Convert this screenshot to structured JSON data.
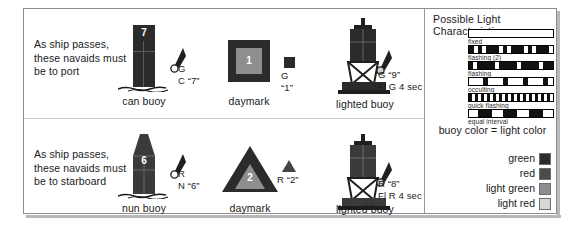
{
  "rows": [
    {
      "id": "port",
      "instruction": "As ship passes,\nthese navaids must\nbe to port",
      "buoy": {
        "caption": "can buoy",
        "number": "7",
        "color": "#2b2b2b"
      },
      "buoy_light_label": "G\nC “7”",
      "daymark": {
        "caption": "daymark",
        "number": "1"
      },
      "daymark_label": "G\n“1”",
      "lighted": {
        "caption": "lighted buoy",
        "number": "9"
      },
      "lighted_label": "G “9”\nFl G 4 sec"
    },
    {
      "id": "starboard",
      "instruction": "As ship passes,\nthese navaids must\nbe to starboard",
      "buoy": {
        "caption": "nun buoy",
        "number": "6",
        "color": "#3a3a3a"
      },
      "buoy_light_label": "R\nN “6”",
      "daymark": {
        "caption": "daymark",
        "number": "2"
      },
      "daymark_label": "R “2”",
      "lighted": {
        "caption": "lighted buoy",
        "number": "8"
      },
      "lighted_label": "R “8”\nFl R 4 sec"
    }
  ],
  "light_characteristics": {
    "title": "Possible Light Characteristics",
    "note": "buoy color  =  light color",
    "bars": [
      {
        "caption": "fixed",
        "style": "normal",
        "segments": []
      },
      {
        "caption": "flashing (2)",
        "style": "inverted",
        "segments": [
          {
            "x": 5,
            "w": 4
          },
          {
            "x": 13,
            "w": 4
          },
          {
            "x": 30,
            "w": 4
          },
          {
            "x": 38,
            "w": 4
          },
          {
            "x": 55,
            "w": 4
          },
          {
            "x": 63,
            "w": 4
          },
          {
            "x": 80,
            "w": 4
          }
        ]
      },
      {
        "caption": "flashing",
        "style": "inverted",
        "segments": [
          {
            "x": 4,
            "w": 4
          },
          {
            "x": 26,
            "w": 4
          },
          {
            "x": 48,
            "w": 4
          },
          {
            "x": 70,
            "w": 4
          }
        ]
      },
      {
        "caption": "occulting",
        "style": "normal",
        "segments": [
          {
            "x": 14,
            "w": 5
          },
          {
            "x": 34,
            "w": 5
          },
          {
            "x": 54,
            "w": 5
          },
          {
            "x": 74,
            "w": 5
          }
        ]
      },
      {
        "caption": "quick flashing",
        "style": "inverted",
        "segments": [
          {
            "x": 3,
            "w": 3
          },
          {
            "x": 9,
            "w": 3
          },
          {
            "x": 15,
            "w": 3
          },
          {
            "x": 21,
            "w": 3
          },
          {
            "x": 27,
            "w": 3
          },
          {
            "x": 33,
            "w": 3
          },
          {
            "x": 39,
            "w": 3
          },
          {
            "x": 45,
            "w": 3
          },
          {
            "x": 51,
            "w": 3
          },
          {
            "x": 57,
            "w": 3
          },
          {
            "x": 63,
            "w": 3
          },
          {
            "x": 69,
            "w": 3
          },
          {
            "x": 75,
            "w": 3
          },
          {
            "x": 81,
            "w": 3
          }
        ]
      },
      {
        "caption": "equal interval",
        "style": "normal",
        "segments": [
          {
            "x": 9,
            "w": 14
          },
          {
            "x": 34,
            "w": 14
          },
          {
            "x": 60,
            "w": 14
          }
        ]
      }
    ]
  },
  "color_legend": [
    {
      "label": "green",
      "hex": "#2b2b2b"
    },
    {
      "label": "red",
      "hex": "#4a4a4a"
    },
    {
      "label": "light green",
      "hex": "#8e8e8e"
    },
    {
      "label": "light red",
      "hex": "#d6d6d6"
    }
  ]
}
